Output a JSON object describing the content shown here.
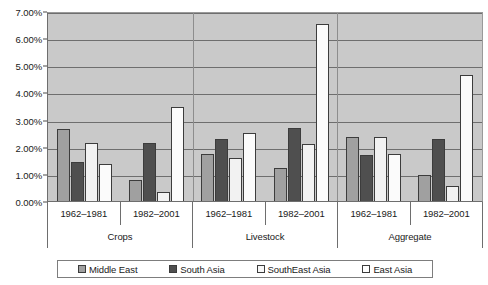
{
  "chart_data": {
    "type": "bar",
    "title": "",
    "xlabel": "",
    "ylabel": "",
    "ylim": [
      0,
      7
    ],
    "yticks": [
      "0.00%",
      "1.00%",
      "2.00%",
      "3.00%",
      "4.00%",
      "5.00%",
      "6.00%",
      "7.00%"
    ],
    "ytick_values": [
      0,
      1,
      2,
      3,
      4,
      5,
      6,
      7
    ],
    "grid": true,
    "legend_position": "bottom",
    "groups": [
      "Crops",
      "Livestock",
      "Aggregate"
    ],
    "periods": [
      "1962–1981",
      "1982–2001"
    ],
    "categories": [
      "Crops 1962–1981",
      "Crops 1982–2001",
      "Livestock 1962–1981",
      "Livestock 1982–2001",
      "Aggregate 1962–1981",
      "Aggregate 1982–2001"
    ],
    "series": [
      {
        "name": "Middle East",
        "color": "#a0a0a0",
        "values": [
          2.67,
          0.78,
          1.75,
          1.2,
          2.35,
          0.95
        ]
      },
      {
        "name": "South Asia",
        "color": "#4f4f4f",
        "values": [
          1.42,
          2.12,
          2.3,
          2.7,
          1.7,
          2.3
        ]
      },
      {
        "name": "SouthEast Asia",
        "color": "#f2f2f2",
        "values": [
          2.15,
          0.35,
          1.6,
          2.1,
          2.35,
          0.57
        ]
      },
      {
        "name": "East Asia",
        "color": "#fbfbfb",
        "values": [
          1.38,
          3.48,
          2.52,
          6.52,
          1.72,
          4.65
        ]
      }
    ]
  },
  "legend": {
    "items": [
      {
        "label": "Middle East"
      },
      {
        "label": "South Asia"
      },
      {
        "label": "SouthEast Asia"
      },
      {
        "label": "East Asia"
      }
    ]
  },
  "axis": {
    "y_ticks": [
      {
        "label": "7.00%"
      },
      {
        "label": "6.00%"
      },
      {
        "label": "5.00%"
      },
      {
        "label": "4.00%"
      },
      {
        "label": "3.00%"
      },
      {
        "label": "2.00%"
      },
      {
        "label": "1.00%"
      },
      {
        "label": "0.00%"
      }
    ],
    "period_labels": [
      {
        "label": "1962–1981"
      },
      {
        "label": "1982–2001"
      },
      {
        "label": "1962–1981"
      },
      {
        "label": "1982–2001"
      },
      {
        "label": "1962–1981"
      },
      {
        "label": "1982–2001"
      }
    ],
    "group_labels": [
      {
        "label": "Crops"
      },
      {
        "label": "Livestock"
      },
      {
        "label": "Aggregate"
      }
    ]
  }
}
